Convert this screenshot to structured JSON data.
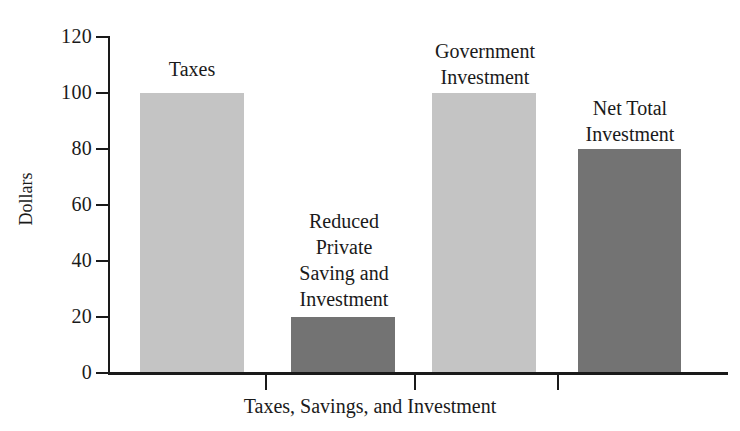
{
  "chart_data": {
    "type": "bar",
    "title": "",
    "xlabel": "Taxes, Savings, and Investment",
    "ylabel": "Dollars",
    "ylim": [
      0,
      120
    ],
    "yticks": [
      0,
      20,
      40,
      60,
      80,
      100,
      120
    ],
    "grid": false,
    "legend": "none",
    "categories": [
      "Taxes",
      "Reduced Private Saving and Investment",
      "Government Investment",
      "Net Total Investment"
    ],
    "values": [
      100,
      20,
      100,
      80
    ],
    "bar_labels": [
      "Taxes",
      "Reduced\nPrivate\nSaving and\nInvestment",
      "Government\nInvestment",
      "Net Total\nInvestment"
    ],
    "bar_colors": [
      "#c4c4c4",
      "#737373",
      "#c4c4c4",
      "#737373"
    ],
    "axis_color": "#1a1a1a",
    "background": "#ffffff"
  },
  "axes": {
    "y_tick_labels": [
      "120",
      "100",
      "80",
      "60",
      "40",
      "20",
      "0"
    ],
    "y_axis_title": "Dollars",
    "x_axis_title": "Taxes, Savings, and Investment"
  }
}
